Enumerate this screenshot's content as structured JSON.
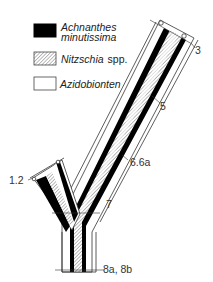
{
  "legend": {
    "items": [
      {
        "pattern": "solid-black",
        "label_line1": "Achnanthes",
        "label_line2": "minutissima"
      },
      {
        "pattern": "hatched",
        "label_italic": "Nitzschia",
        "label_suffix": "spp."
      },
      {
        "pattern": "empty",
        "label_italic": "Azidobionten"
      }
    ]
  },
  "stations": {
    "s3": "3",
    "s5": "5",
    "s66a": "6.6a",
    "s12": "1.2",
    "s7": "7",
    "s8": "8a, 8b"
  },
  "colors": {
    "achnanthes": "#000000",
    "nitzschia_hatch": "#888888",
    "outline": "#333333",
    "background": "#ffffff"
  }
}
